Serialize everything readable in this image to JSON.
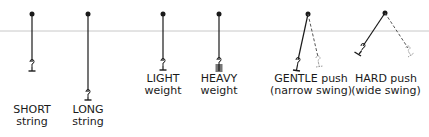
{
  "diagram": {
    "colors": {
      "ink": "#1a1a1a",
      "rule": "#c8c8c8",
      "dash": "#555555"
    },
    "pendulums": [
      {
        "id": "short",
        "line1": "SHORT",
        "line2": "string"
      },
      {
        "id": "long",
        "line1": "LONG",
        "line2": "string"
      },
      {
        "id": "light",
        "line1": "LIGHT",
        "line2": "weight"
      },
      {
        "id": "heavy",
        "line1": "HEAVY",
        "line2": "weight"
      },
      {
        "id": "gentle",
        "line1": "GENTLE push",
        "line2": "(narrow swing)"
      },
      {
        "id": "hard",
        "line1": "HARD push",
        "line2": "(wide swing)"
      }
    ]
  }
}
